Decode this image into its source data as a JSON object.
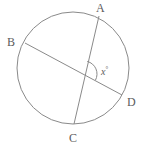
{
  "figure": {
    "kind": "circle-with-two-intersecting-chords",
    "stroke_color": "#8a8a8a",
    "label_color": "#5b5b5b",
    "background_color": "#ffffff",
    "circle": {
      "cx": 73,
      "cy": 68,
      "r": 56
    },
    "points": {
      "A": {
        "x": 99,
        "y": 16
      },
      "B": {
        "x": 25,
        "y": 43
      },
      "C": {
        "x": 74,
        "y": 124
      },
      "D": {
        "x": 122,
        "y": 95
      },
      "intersection": {
        "x": 84,
        "y": 74
      }
    },
    "chords": [
      {
        "name": "AC",
        "from": "A",
        "to": "C"
      },
      {
        "name": "BD",
        "from": "B",
        "to": "D"
      }
    ],
    "labels": {
      "A": "A",
      "B": "B",
      "C": "C",
      "D": "D"
    },
    "angle": {
      "variable": "x",
      "degree_symbol": "°",
      "at": "intersection",
      "between": [
        "A",
        "D"
      ],
      "arc_radius": 13
    }
  }
}
